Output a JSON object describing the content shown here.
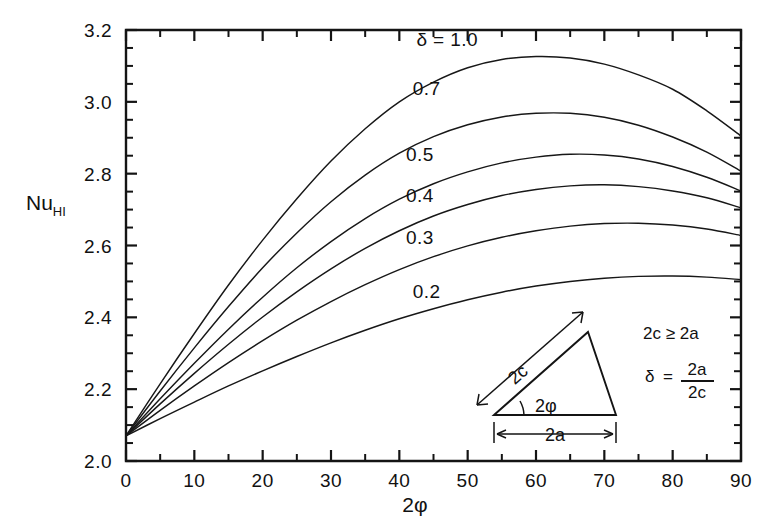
{
  "figure": {
    "background": "#ffffff",
    "ink": "#141414"
  },
  "axes": {
    "y_title_main": "Nu",
    "y_title_sub": "HI",
    "x_title": "2φ",
    "x_ticklabels": [
      "0",
      "10",
      "20",
      "30",
      "40",
      "50",
      "60",
      "70",
      "80",
      "90"
    ],
    "y_ticklabels": [
      "2.0",
      "2.2",
      "2.4",
      "2.6",
      "2.8",
      "3.0",
      "3.2"
    ]
  },
  "inset": {
    "side_hyp_label": "2c",
    "side_base_label": "2a",
    "angle_label": "2φ",
    "relation": "2c ≥ 2a",
    "definition_lhs": "δ",
    "definition_eq": "=",
    "definition_num": "2a",
    "definition_den": "2c"
  },
  "chart_data": {
    "type": "line",
    "title": "",
    "xlabel": "2φ",
    "ylabel": "Nu_HI",
    "xlim": [
      0,
      90
    ],
    "ylim": [
      2.0,
      3.2
    ],
    "xticks": [
      0,
      10,
      20,
      30,
      40,
      50,
      60,
      70,
      80,
      90
    ],
    "yticks": [
      2.0,
      2.2,
      2.4,
      2.6,
      2.8,
      3.0,
      3.2
    ],
    "x_minor_step": 5,
    "y_minor_step": 0.05,
    "grid": false,
    "legend": "inline-curve-labels",
    "x": [
      0,
      5,
      10,
      15,
      20,
      25,
      30,
      35,
      40,
      45,
      50,
      55,
      60,
      65,
      70,
      75,
      80,
      85,
      90
    ],
    "series": [
      {
        "name": "δ = 1.0",
        "label": "δ = 1.0",
        "label_x": 47,
        "label_y": 3.155,
        "values": [
          2.07,
          2.215,
          2.355,
          2.49,
          2.615,
          2.73,
          2.835,
          2.925,
          3.0,
          3.055,
          3.095,
          3.118,
          3.126,
          3.122,
          3.105,
          3.075,
          3.035,
          2.975,
          2.905
        ]
      },
      {
        "name": "0.7",
        "label": "0.7",
        "label_x": 44,
        "label_y": 3.02,
        "values": [
          2.07,
          2.195,
          2.315,
          2.43,
          2.538,
          2.635,
          2.722,
          2.796,
          2.857,
          2.903,
          2.936,
          2.958,
          2.968,
          2.968,
          2.957,
          2.935,
          2.902,
          2.86,
          2.807
        ]
      },
      {
        "name": "0.5",
        "label": "0.5",
        "label_x": 43,
        "label_y": 2.835,
        "values": [
          2.07,
          2.173,
          2.272,
          2.367,
          2.456,
          2.538,
          2.611,
          2.675,
          2.729,
          2.772,
          2.805,
          2.83,
          2.846,
          2.854,
          2.852,
          2.841,
          2.82,
          2.79,
          2.752
        ]
      },
      {
        "name": "0.4",
        "label": "0.4",
        "label_x": 43,
        "label_y": 2.72,
        "values": [
          2.07,
          2.159,
          2.244,
          2.325,
          2.401,
          2.471,
          2.535,
          2.592,
          2.641,
          2.682,
          2.714,
          2.739,
          2.756,
          2.766,
          2.769,
          2.764,
          2.752,
          2.733,
          2.705
        ]
      },
      {
        "name": "0.3",
        "label": "0.3",
        "label_x": 43,
        "label_y": 2.605,
        "values": [
          2.07,
          2.141,
          2.209,
          2.274,
          2.335,
          2.392,
          2.444,
          2.491,
          2.533,
          2.569,
          2.599,
          2.623,
          2.641,
          2.654,
          2.661,
          2.662,
          2.657,
          2.646,
          2.628
        ]
      },
      {
        "name": "0.2",
        "label": "0.2",
        "label_x": 44,
        "label_y": 2.455,
        "values": [
          2.07,
          2.118,
          2.164,
          2.209,
          2.251,
          2.291,
          2.329,
          2.364,
          2.396,
          2.424,
          2.449,
          2.47,
          2.487,
          2.5,
          2.509,
          2.514,
          2.515,
          2.512,
          2.505
        ]
      }
    ]
  }
}
